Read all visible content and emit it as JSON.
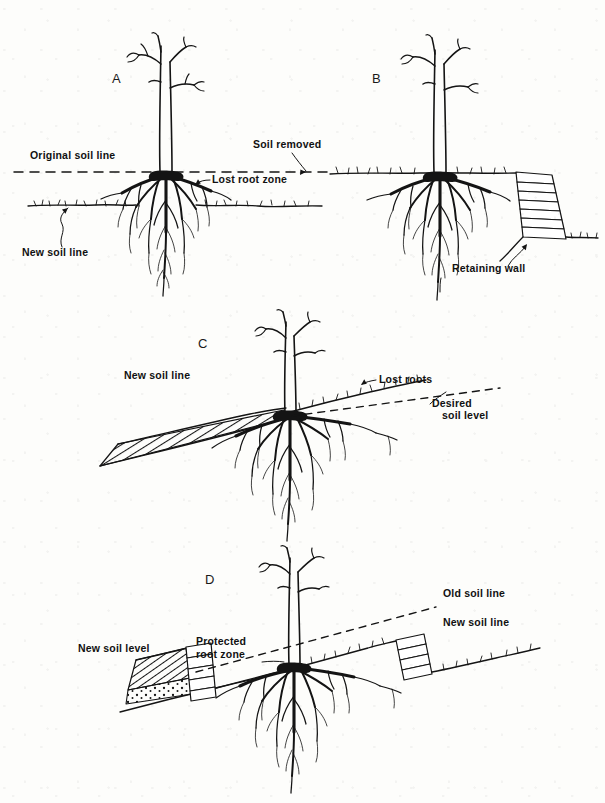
{
  "figure": {
    "ink_color": "#141414",
    "background_color": "#fdfdfb",
    "panels": [
      {
        "id": "A",
        "letter": "A",
        "letter_x": 112,
        "letter_y": 83,
        "caption": "Soil removed around tree lowers grade and destroys the outer root zone",
        "labels": [
          {
            "key": "original_soil_line",
            "text": "Original soil line",
            "x": 30,
            "y": 159,
            "anchor": "start"
          },
          {
            "key": "soil_removed",
            "text": "Soil removed",
            "x": 253,
            "y": 148,
            "anchor": "start"
          },
          {
            "key": "lost_root_zone",
            "text": "Lost root zone",
            "x": 212,
            "y": 183,
            "anchor": "start"
          },
          {
            "key": "new_soil_line",
            "text": "New soil line",
            "x": 22,
            "y": 256,
            "anchor": "start"
          }
        ]
      },
      {
        "id": "B",
        "letter": "B",
        "letter_x": 372,
        "letter_y": 83,
        "caption": "Retaining wall built at the dripline preserves the original grade over the roots",
        "labels": [
          {
            "key": "retaining_wall",
            "text": "Retaining wall",
            "x": 452,
            "y": 272,
            "anchor": "start"
          }
        ]
      },
      {
        "id": "C",
        "letter": "C",
        "letter_x": 198,
        "letter_y": 348,
        "caption": "Fill soil added over the root zone on a slope smothers and kills roots",
        "labels": [
          {
            "key": "new_soil_line",
            "text": "New soil line",
            "x": 124,
            "y": 379,
            "anchor": "start"
          },
          {
            "key": "lost_roots",
            "text": "Lost roots",
            "x": 379,
            "y": 383,
            "anchor": "start"
          },
          {
            "key": "desired_line_1",
            "text": "Desired",
            "x": 432,
            "y": 407,
            "anchor": "start"
          },
          {
            "key": "desired_line_2",
            "text": "soil level",
            "x": 442,
            "y": 419,
            "anchor": "start"
          }
        ]
      },
      {
        "id": "D",
        "letter": "D",
        "letter_x": 205,
        "letter_y": 584,
        "caption": "Dry wells and retaining walls keep fill off the root zone and protect the tree",
        "labels": [
          {
            "key": "new_soil_level",
            "text": "New soil level",
            "x": 78,
            "y": 652,
            "anchor": "start"
          },
          {
            "key": "protected_1",
            "text": "Protected",
            "x": 196,
            "y": 645,
            "anchor": "start"
          },
          {
            "key": "protected_2",
            "text": "root zone",
            "x": 196,
            "y": 658,
            "anchor": "start"
          },
          {
            "key": "old_soil_line",
            "text": "Old soil line",
            "x": 443,
            "y": 597,
            "anchor": "start"
          },
          {
            "key": "new_soil_line",
            "text": "New soil line",
            "x": 443,
            "y": 626,
            "anchor": "start"
          }
        ]
      }
    ]
  }
}
